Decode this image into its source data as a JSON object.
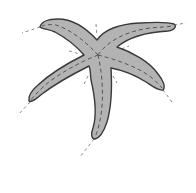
{
  "figure": {
    "subject": "starfish",
    "arm_count": 5,
    "colors": {
      "body_fill": "#b3b3b3",
      "outline": "#3a3a3a",
      "midline_dash": "#555555",
      "symmetry_dash": "#8a8a8a",
      "background": "#ffffff"
    },
    "arms": [
      {
        "name": "upper-left",
        "tip": [
          40,
          26
        ]
      },
      {
        "name": "upper-right",
        "tip": [
          175,
          25
        ]
      },
      {
        "name": "right",
        "tip": [
          163,
          89
        ]
      },
      {
        "name": "left",
        "tip": [
          30,
          102
        ]
      },
      {
        "name": "bottom",
        "tip": [
          95,
          138
        ]
      }
    ],
    "center": [
      98,
      55
    ]
  }
}
